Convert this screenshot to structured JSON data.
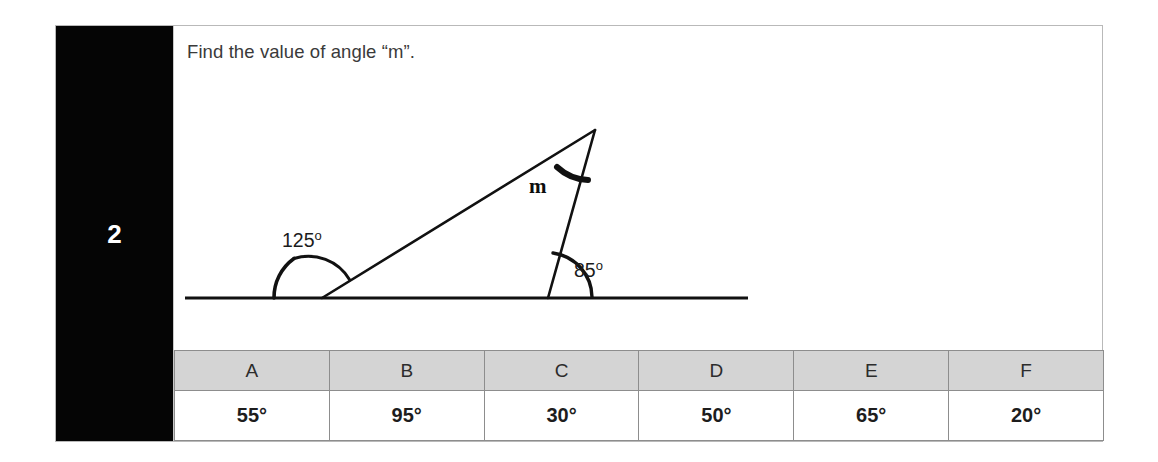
{
  "question": {
    "number": "2",
    "prompt": "Find the value of angle “m”.",
    "unknown_label": "m"
  },
  "figure": {
    "type": "geometry-diagram",
    "labels": {
      "left_angle": "125",
      "right_angle": "85",
      "apex_angle": "m",
      "degree_mark": "o"
    },
    "left_angle_text": "125º",
    "right_angle_text": "85º",
    "stroke_color": "#111111"
  },
  "answers": {
    "headers": [
      "A",
      "B",
      "C",
      "D",
      "E",
      "F"
    ],
    "values": [
      "55°",
      "95°",
      "30°",
      "50°",
      "65°",
      "20°"
    ]
  },
  "colors": {
    "rail_background": "#050505",
    "rail_text": "#ffffff",
    "header_background": "#d4d4d4",
    "card_border": "#b9b9b9",
    "text": "#3a3a3a"
  }
}
